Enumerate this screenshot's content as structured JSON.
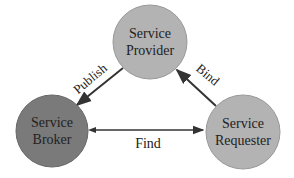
{
  "nodes": {
    "provider": {
      "line1": "Service",
      "line2": "Provider",
      "fill": "#b3b3b3"
    },
    "broker": {
      "line1": "Service",
      "line2": "Broker",
      "fill": "#7a7a7a"
    },
    "requester": {
      "line1": "Service",
      "line2": "Requester",
      "fill": "#b3b3b3"
    }
  },
  "edges": {
    "publish": "Publish",
    "bind": "Bind",
    "find": "Find"
  }
}
